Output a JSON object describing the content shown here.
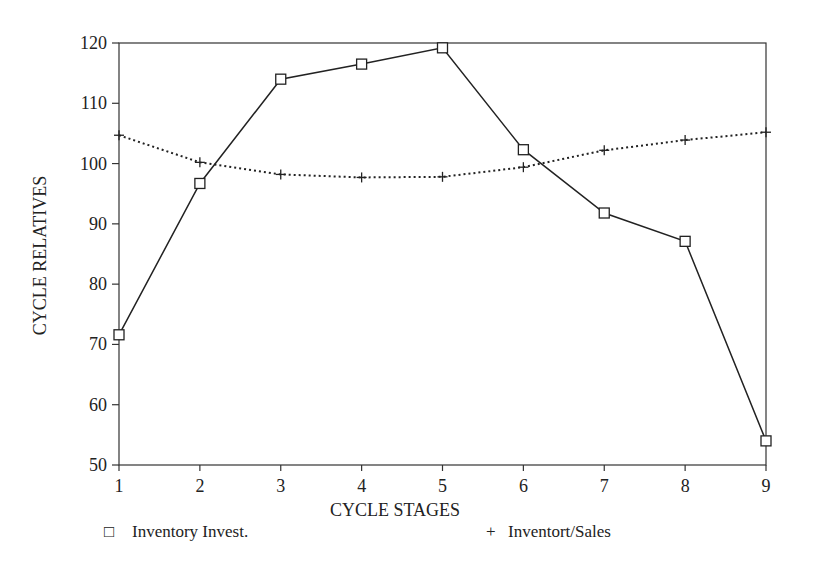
{
  "chart_data": {
    "type": "line",
    "title": "",
    "xlabel": "CYCLE STAGES",
    "ylabel": "CYCLE RELATIVES",
    "x": [
      1,
      2,
      3,
      4,
      5,
      6,
      7,
      8,
      9
    ],
    "xticks": [
      "1",
      "2",
      "3",
      "4",
      "5",
      "6",
      "7",
      "8",
      "9"
    ],
    "yticks": [
      "50",
      "60",
      "70",
      "80",
      "90",
      "100",
      "110",
      "120"
    ],
    "ylim": [
      50,
      120
    ],
    "xlim": [
      1,
      9
    ],
    "grid": false,
    "legend_position": "bottom",
    "series": [
      {
        "name": "Inventory Invest.",
        "marker": "square",
        "line": "solid",
        "values": [
          71.6,
          96.7,
          114.0,
          116.5,
          119.2,
          102.3,
          91.8,
          87.1,
          54.0
        ]
      },
      {
        "name": "Inventort/Sales",
        "marker": "plus",
        "line": "dotted",
        "values": [
          104.7,
          100.2,
          98.2,
          97.7,
          97.8,
          99.4,
          102.2,
          103.9,
          105.2
        ]
      }
    ]
  },
  "legend": {
    "items": [
      {
        "symbol": "□",
        "label": "Inventory Invest."
      },
      {
        "symbol": "+",
        "label": "Inventort/Sales"
      }
    ]
  }
}
